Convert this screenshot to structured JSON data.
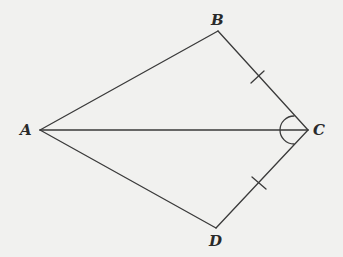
{
  "diagram": {
    "type": "kite",
    "background": "#f1f1ef",
    "stroke_color": "#3a3a3a",
    "points": {
      "A": {
        "label": "A",
        "x": 40,
        "y": 130
      },
      "B": {
        "label": "B",
        "x": 218,
        "y": 31
      },
      "C": {
        "label": "C",
        "x": 308,
        "y": 130
      },
      "D": {
        "label": "D",
        "x": 216,
        "y": 228
      }
    },
    "segments": [
      "AB",
      "BC",
      "CD",
      "DA",
      "AC"
    ],
    "equal_marks": [
      {
        "segment": "BC",
        "ticks": 1
      },
      {
        "segment": "CD",
        "ticks": 1
      }
    ],
    "angle_marks": [
      {
        "vertex": "C",
        "between": [
          "B",
          "D"
        ],
        "arcs": 1,
        "note": "angle BCA = angle DCA (split by AC)"
      }
    ]
  }
}
